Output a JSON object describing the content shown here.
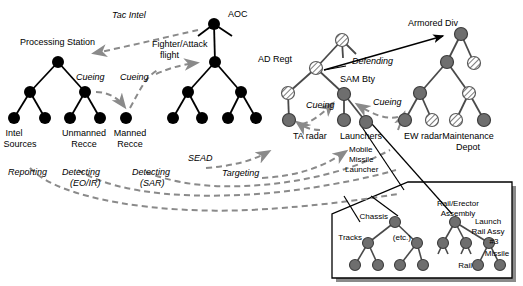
{
  "figure": {
    "colors": {
      "node_black": "#000000",
      "node_gray": "#6e6e6e",
      "node_hatched_fill": "#ffffff",
      "node_hatched_stroke": "#5a5a5a",
      "link_black": "#000000",
      "link_gray": "#4a4a4a",
      "dashed_gray": "#8a8a8a",
      "inset_border": "#000000",
      "inset_shadow": "#8a8a8a",
      "background": "#ffffff"
    }
  },
  "labels": {
    "processing_station": "Processing Station",
    "tac_intel": "Tac Intel",
    "aoc": "AOC",
    "fighter_attack_flight_line1": "Fighter/Attack",
    "fighter_attack_flight_line2": "flight",
    "cueing_1": "Cueing",
    "cueing_2": "Cueing",
    "intel_sources_line1": "Intel",
    "intel_sources_line2": "Sources",
    "unmanned_recce_line1": "Unmanned",
    "unmanned_recce_line2": "Recce",
    "manned_recce_line1": "Manned",
    "manned_recce_line2": "Recce",
    "reporting": "Reporting",
    "detecting_eoir_line1": "Detecting",
    "detecting_eoir_line2": "(EO/IR)",
    "detecting_sar_line1": "Detecting",
    "detecting_sar_line2": "(SAR)",
    "sead": "SEAD",
    "targeting": "Targeting",
    "ad_regt": "AD Regt",
    "defending": "Defending",
    "sam_bty": "SAM Bty",
    "cueing_3": "Cueing",
    "cueing_4": "Cueing",
    "ta_radar": "TA radar",
    "launchers": "Launchers",
    "ew_radar": "EW radar",
    "armored_div": "Armored Div",
    "maintenance_depot_line1": "Maintenance",
    "maintenance_depot_line2": "Depot",
    "mobile_missile_launcher_line1": "Mobile",
    "mobile_missile_launcher_line2": "Missile",
    "mobile_missile_launcher_line3": "Launcher",
    "rail_erector_assembly_line1": "Rail/Erector",
    "rail_erector_assembly_line2": "Assembly",
    "launch_rail_assy_line1": "Launch",
    "launch_rail_assy_line2": "Rail Assy",
    "launch_rail_assy_line3": "#3",
    "missile": "Missile",
    "chassis": "Chassis",
    "tracks": "Tracks",
    "etc": "(etc.)",
    "rail": "Rail"
  },
  "trees": {
    "processing_station": {
      "name": "Processing Station",
      "node_style": "black",
      "nodes": [
        {
          "id": "ps-root",
          "x": 58,
          "y": 62
        },
        {
          "id": "ps-l",
          "x": 30,
          "y": 92
        },
        {
          "id": "ps-r",
          "x": 85,
          "y": 92
        },
        {
          "id": "ps-ll",
          "x": 14,
          "y": 118
        },
        {
          "id": "ps-lr",
          "x": 45,
          "y": 118
        },
        {
          "id": "ps-rl",
          "x": 70,
          "y": 118
        },
        {
          "id": "ps-rr",
          "x": 100,
          "y": 118
        },
        {
          "id": "ps-manned",
          "x": 126,
          "y": 118
        }
      ],
      "edges": [
        [
          "ps-root",
          "ps-l"
        ],
        [
          "ps-root",
          "ps-r"
        ],
        [
          "ps-l",
          "ps-ll"
        ],
        [
          "ps-l",
          "ps-lr"
        ],
        [
          "ps-r",
          "ps-rl"
        ],
        [
          "ps-r",
          "ps-rr"
        ]
      ]
    },
    "aoc": {
      "name": "AOC",
      "node_style": "black",
      "nodes": [
        {
          "id": "aoc-root",
          "x": 214,
          "y": 24
        },
        {
          "id": "aoc-mid",
          "x": 215,
          "y": 62
        },
        {
          "id": "aoc-l",
          "x": 188,
          "y": 92
        },
        {
          "id": "aoc-r",
          "x": 241,
          "y": 92
        },
        {
          "id": "aoc-ll",
          "x": 173,
          "y": 118
        },
        {
          "id": "aoc-lr",
          "x": 202,
          "y": 118
        },
        {
          "id": "aoc-rl",
          "x": 228,
          "y": 118
        },
        {
          "id": "aoc-rr",
          "x": 256,
          "y": 118
        }
      ],
      "edges": [
        [
          "aoc-root",
          "aoc-mid"
        ],
        [
          "aoc-mid",
          "aoc-l"
        ],
        [
          "aoc-mid",
          "aoc-r"
        ],
        [
          "aoc-l",
          "aoc-ll"
        ],
        [
          "aoc-l",
          "aoc-lr"
        ],
        [
          "aoc-r",
          "aoc-rl"
        ],
        [
          "aoc-r",
          "aoc-rr"
        ]
      ]
    },
    "ad_regt": {
      "name": "AD Regt / SAM Bty",
      "node_style": "mixed",
      "nodes": [
        {
          "id": "ad-top",
          "x": 342,
          "y": 40,
          "style": "hatched"
        },
        {
          "id": "ad-regt",
          "x": 316,
          "y": 68,
          "style": "hatched"
        },
        {
          "id": "ad-l",
          "x": 288,
          "y": 93,
          "style": "hatched"
        },
        {
          "id": "sam-bty",
          "x": 344,
          "y": 94,
          "style": "gray"
        },
        {
          "id": "ta-radar",
          "x": 289,
          "y": 120,
          "style": "gray"
        },
        {
          "id": "launchers-a",
          "x": 344,
          "y": 120,
          "style": "gray"
        },
        {
          "id": "launchers-b",
          "x": 366,
          "y": 122,
          "style": "gray"
        }
      ],
      "edges": [
        [
          "ad-top",
          "ad-regt"
        ],
        [
          "ad-regt",
          "ad-l"
        ],
        [
          "ad-regt",
          "sam-bty"
        ],
        [
          "ad-l",
          "ta-radar"
        ],
        [
          "sam-bty",
          "launchers-a"
        ],
        [
          "sam-bty",
          "launchers-b"
        ]
      ]
    },
    "armored_div": {
      "name": "Armored Div",
      "node_style": "mixed",
      "nodes": [
        {
          "id": "arm-root",
          "x": 461,
          "y": 34,
          "style": "gray"
        },
        {
          "id": "arm-l",
          "x": 447,
          "y": 62,
          "style": "gray"
        },
        {
          "id": "arm-r",
          "x": 474,
          "y": 63,
          "style": "hatched"
        },
        {
          "id": "arm-ll",
          "x": 420,
          "y": 93,
          "style": "gray"
        },
        {
          "id": "arm-lr",
          "x": 469,
          "y": 93,
          "style": "hatched"
        },
        {
          "id": "arm-lll",
          "x": 405,
          "y": 120,
          "style": "gray"
        },
        {
          "id": "arm-llr",
          "x": 432,
          "y": 120,
          "style": "hatched"
        },
        {
          "id": "arm-lrl",
          "x": 456,
          "y": 120,
          "style": "hatched"
        },
        {
          "id": "arm-lrr",
          "x": 484,
          "y": 120,
          "style": "gray"
        }
      ],
      "edges": [
        [
          "arm-root",
          "arm-l"
        ],
        [
          "arm-root",
          "arm-r"
        ],
        [
          "arm-l",
          "arm-ll"
        ],
        [
          "arm-l",
          "arm-lr"
        ],
        [
          "arm-ll",
          "arm-lll"
        ],
        [
          "arm-ll",
          "arm-llr"
        ],
        [
          "arm-lr",
          "arm-lrl"
        ],
        [
          "arm-lr",
          "arm-lrr"
        ]
      ]
    },
    "inset_launcher": {
      "name": "Mobile Missile Launcher breakdown",
      "node_style": "gray",
      "nodes": [
        {
          "id": "ins-chassis",
          "x": 395,
          "y": 222
        },
        {
          "id": "ins-rea",
          "x": 455,
          "y": 222
        },
        {
          "id": "ins-tracks",
          "x": 368,
          "y": 243
        },
        {
          "id": "ins-etc",
          "x": 417,
          "y": 243
        },
        {
          "id": "ins-n3",
          "x": 443,
          "y": 243
        },
        {
          "id": "ins-n4",
          "x": 466,
          "y": 243
        },
        {
          "id": "ins-lra3",
          "x": 489,
          "y": 243
        },
        {
          "id": "ins-t1",
          "x": 355,
          "y": 265
        },
        {
          "id": "ins-t2",
          "x": 378,
          "y": 265
        },
        {
          "id": "ins-t3",
          "x": 400,
          "y": 265
        },
        {
          "id": "ins-t4",
          "x": 423,
          "y": 265
        },
        {
          "id": "ins-rail",
          "x": 478,
          "y": 265
        },
        {
          "id": "ins-missile",
          "x": 500,
          "y": 265
        }
      ],
      "edges": [
        [
          "ins-chassis",
          "ins-tracks"
        ],
        [
          "ins-chassis",
          "ins-etc"
        ],
        [
          "ins-rea",
          "ins-n3"
        ],
        [
          "ins-rea",
          "ins-n4"
        ],
        [
          "ins-rea",
          "ins-lra3"
        ],
        [
          "ins-tracks",
          "ins-t1"
        ],
        [
          "ins-tracks",
          "ins-t2"
        ],
        [
          "ins-etc",
          "ins-t3"
        ],
        [
          "ins-etc",
          "ins-t4"
        ],
        [
          "ins-lra3",
          "ins-rail"
        ],
        [
          "ins-lra3",
          "ins-missile"
        ]
      ]
    }
  },
  "relations": [
    {
      "label": "Tac Intel",
      "from": "AOC",
      "to": "Processing Station",
      "style": "dashed"
    },
    {
      "label": "Cueing",
      "from": "Unmanned Recce",
      "to": "Manned Recce",
      "style": "dashed"
    },
    {
      "label": "Cueing",
      "from": "Manned Recce",
      "to": "Fighter/Attack flight",
      "style": "dashed"
    },
    {
      "label": "Reporting",
      "from": "Intel Sources",
      "to": "downstream",
      "style": "dashed"
    },
    {
      "label": "Detecting (EO/IR)",
      "from": "Unmanned Recce",
      "to": "SAM Bty elements",
      "style": "dashed"
    },
    {
      "label": "Detecting (SAR)",
      "from": "Manned Recce",
      "to": "SAM Bty elements",
      "style": "dashed"
    },
    {
      "label": "SEAD",
      "from": "Fighter/Attack flight",
      "to": "TA radar",
      "style": "dashed"
    },
    {
      "label": "Targeting",
      "from": "Fighter/Attack flight",
      "to": "Launchers",
      "style": "dashed"
    },
    {
      "label": "Defending",
      "from": "AD Regt",
      "to": "Armored Div",
      "style": "solid"
    },
    {
      "label": "Cueing",
      "from": "TA radar",
      "to": "SAM Bty",
      "style": "dashed"
    },
    {
      "label": "Cueing",
      "from": "EW radar",
      "to": "SAM Bty",
      "style": "dashed"
    }
  ]
}
